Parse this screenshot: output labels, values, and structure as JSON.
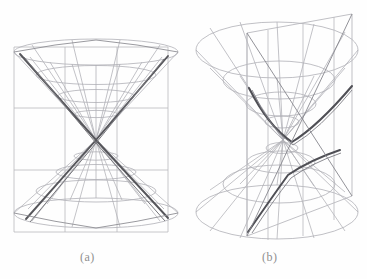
{
  "figure": {
    "background_color": "#fefefe",
    "panels": [
      {
        "id": "a",
        "caption": "(a)",
        "description": "Double cone cut by a vertical plane, degenerate/intersecting-lines section through the apex",
        "plane_type": "vertical rectangular grid plane",
        "intersection_curve": "two intersecting lines through the vertex",
        "apex": {
          "x": 96,
          "y": 140
        },
        "upper_cone": {
          "rim_cx": 96,
          "rim_cy": 52,
          "rim_rx": 82,
          "rim_ry": 13
        },
        "lower_cone": {
          "rim_cx": 96,
          "rim_cy": 213,
          "rim_rx": 82,
          "rim_ry": 15
        },
        "plane_rect": {
          "x1": 14,
          "y1": 47,
          "x2": 168,
          "y2": 232
        },
        "grid": {
          "meridians": 12,
          "parallels": 4,
          "plane_cols": 3,
          "plane_rows": 3
        }
      },
      {
        "id": "b",
        "caption": "(b)",
        "description": "Double cone cut by a steeply tilted plane, producing a hyperbola with two branches",
        "plane_type": "tilted quadrilateral plane",
        "intersection_curve": "hyperbola (two branches)",
        "apex": {
          "x": 283,
          "y": 140
        },
        "upper_cone": {
          "rim_cx": 277,
          "rim_cy": 50,
          "rim_rx": 81,
          "rim_ry": 28
        },
        "lower_cone": {
          "rim_cx": 277,
          "rim_cy": 212,
          "rim_rx": 81,
          "rim_ry": 27
        },
        "grid": {
          "meridians": 12,
          "parallels": 4
        }
      }
    ],
    "colors": {
      "wireframe_light": "#b9b9bd",
      "wireframe_mid": "#97979c",
      "wireframe_dark": "#6b6b70",
      "curve_accent": "#4a4a4f",
      "caption": "#8f8f8f",
      "background": "#fefefe"
    }
  }
}
